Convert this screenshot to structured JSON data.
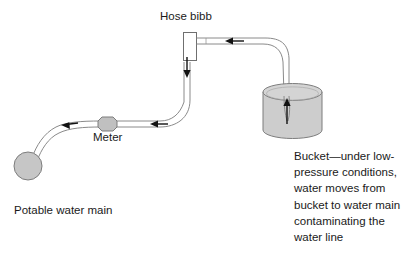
{
  "diagram": {
    "labels": {
      "hose_bibb": "Hose bibb",
      "meter": "Meter",
      "potable_water_main": "Potable water main",
      "bucket_note": "Bucket—under low-pressure conditions, water moves from bucket to water main contaminating the water line"
    },
    "colors": {
      "outline": "#8a8a8a",
      "fill_gray": "#c8c8c8",
      "arrow": "#111111",
      "text": "#1a1a1a",
      "background": "#ffffff"
    },
    "components": [
      {
        "name": "potable-water-main",
        "shape": "circle",
        "fill": "#c6c6c6"
      },
      {
        "name": "water-meter",
        "shape": "octagon",
        "fill": "#c6c6c6"
      },
      {
        "name": "hose-bibb",
        "shape": "rectangle",
        "fill": "#ffffff"
      },
      {
        "name": "bucket",
        "shape": "cylinder",
        "fill": "#cdcdcd"
      },
      {
        "name": "hose",
        "shape": "tube"
      },
      {
        "name": "supply-pipe",
        "shape": "tube"
      }
    ],
    "flow_arrows": [
      {
        "name": "arrow-in-bucket",
        "direction": "up"
      },
      {
        "name": "arrow-hose-to-bibb",
        "direction": "left"
      },
      {
        "name": "arrow-bibb-downpipe",
        "direction": "down"
      },
      {
        "name": "arrow-pipe-to-meter",
        "direction": "left"
      },
      {
        "name": "arrow-meter-to-main",
        "direction": "left"
      }
    ]
  }
}
